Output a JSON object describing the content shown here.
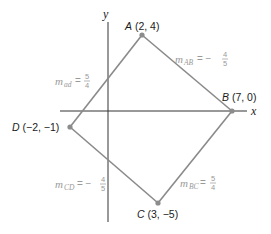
{
  "diagram": {
    "type": "coordinate-plane-quadrilateral",
    "axes": {
      "x_label": "x",
      "y_label": "y"
    },
    "points": [
      {
        "id": "A",
        "letter": "A",
        "coords": " (2, 4)",
        "x": 2,
        "y": 4
      },
      {
        "id": "B",
        "letter": "B",
        "coords": " (7, 0)",
        "x": 7,
        "y": 0
      },
      {
        "id": "C",
        "letter": "C",
        "coords": " (3, −5)",
        "x": 3,
        "y": -5
      },
      {
        "id": "D",
        "letter": "D",
        "coords": " (−2, −1)",
        "x": -2,
        "y": -1
      }
    ],
    "slopes": [
      {
        "segment": "AB",
        "m": "m",
        "sub": "AB",
        "eq": "= −",
        "num": "4",
        "den": "5"
      },
      {
        "segment": "AD",
        "m": "m",
        "sub": "ad",
        "eq": "=",
        "num": "5",
        "den": "4"
      },
      {
        "segment": "CD",
        "m": "m",
        "sub": "CD",
        "eq": "= −",
        "num": "4",
        "den": "5"
      },
      {
        "segment": "BC",
        "m": "m",
        "sub": "BC",
        "eq": "=",
        "num": "5",
        "den": "4"
      }
    ],
    "colors": {
      "axis": "#333333",
      "edge": "#8a8a8a",
      "vertex": "#8c8c8c",
      "slope_text": "#9a9a9a",
      "point_text": "#1a1a1a"
    }
  }
}
